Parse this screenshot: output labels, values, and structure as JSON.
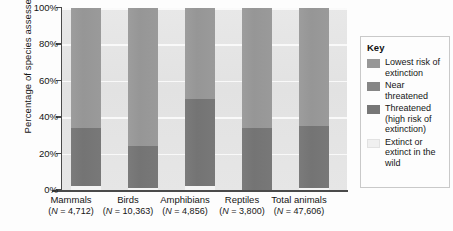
{
  "chart_data": {
    "type": "bar",
    "subtype": "stacked-100-percent",
    "title": "",
    "xlabel": "",
    "ylabel": "Percentage of species assessed",
    "ylim": [
      0,
      100
    ],
    "ytick_labels": [
      "0%",
      "20%",
      "40%",
      "60%",
      "80%",
      "100%"
    ],
    "ytick_values": [
      0,
      20,
      40,
      60,
      80,
      100
    ],
    "grid": true,
    "grid_orientation": "horizontal",
    "legend_position": "right",
    "legend_title": "Key",
    "categories": [
      "Mammals",
      "Birds",
      "Amphibians",
      "Reptiles",
      "Total animals"
    ],
    "category_sublabels": [
      "(N = 4,712)",
      "(N = 10,363)",
      "(N = 4,856)",
      "(N = 3,800)",
      "(N = 47,606)"
    ],
    "category_n_values": [
      4712,
      10363,
      4856,
      3800,
      47606
    ],
    "series": [
      {
        "name": "Lowest risk of extinction",
        "color": "#979797",
        "values": [
          66,
          76,
          50,
          66,
          65
        ]
      },
      {
        "name": "Near threatened",
        "color": "#868686",
        "values": [
          0,
          0,
          0,
          0,
          0
        ]
      },
      {
        "name": "Threatened (high risk of extinction)",
        "color": "#777777",
        "values": [
          32,
          23,
          48,
          34,
          34
        ]
      },
      {
        "name": "Extinct or extinct in the wild",
        "color": "#f4f4f4",
        "values": [
          2,
          1,
          2,
          0,
          1
        ]
      }
    ]
  },
  "axis": {
    "y_title": "Percentage of species assessed",
    "ticks": [
      "100%",
      "80%",
      "60%",
      "40%",
      "20%",
      "0%"
    ]
  },
  "legend": {
    "title": "Key",
    "items": [
      {
        "label": "Lowest risk of extinction",
        "color": "#979797"
      },
      {
        "label": "Near threatened",
        "color": "#868686"
      },
      {
        "label": "Threatened (high risk of extinction)",
        "color": "#777777"
      },
      {
        "label": "Extinct or extinct in the wild",
        "color": "#f0f0f0"
      }
    ]
  },
  "categories": [
    {
      "name": "Mammals",
      "n": "(N = 4,712)"
    },
    {
      "name": "Birds",
      "n": "(N = 10,363)"
    },
    {
      "name": "Amphibians",
      "n": "(N = 4,856)"
    },
    {
      "name": "Reptiles",
      "n": "(N = 3,800)"
    },
    {
      "name": "Total animals",
      "n": "(N = 47,606)"
    }
  ]
}
